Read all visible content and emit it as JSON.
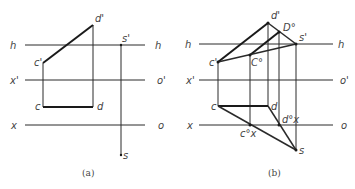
{
  "figures": [
    {
      "id": "a",
      "caption": "(a)",
      "labels": {
        "h_left": "h",
        "h_right": "h",
        "x1_left": "x'",
        "o1_right": "o'",
        "x_left": "x",
        "o_right": "o",
        "d1": "d'",
        "c1": "c'",
        "s1": "s'",
        "c": "c",
        "d": "d",
        "s": "s"
      }
    },
    {
      "id": "b",
      "caption": "(b)",
      "labels": {
        "h_left": "h",
        "h_right": "h",
        "x1_left": "x'",
        "o1_right": "o'",
        "x_left": "x",
        "o_right": "o",
        "d1": "d'",
        "D0": "D°",
        "s1": "s'",
        "c1": "c'",
        "C0": "C°",
        "c": "c",
        "d": "d",
        "cx0": "c°x",
        "dx0": "d°x",
        "s": "s"
      }
    }
  ]
}
